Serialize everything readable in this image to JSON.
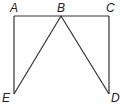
{
  "diagram": {
    "points": {
      "A": {
        "label": "A",
        "x": 14,
        "y": 16
      },
      "B": {
        "label": "B",
        "x": 61,
        "y": 16
      },
      "C": {
        "label": "C",
        "x": 109,
        "y": 16
      },
      "D": {
        "label": "D",
        "x": 109,
        "y": 94
      },
      "E": {
        "label": "E",
        "x": 14,
        "y": 94
      }
    },
    "segments": [
      "AB",
      "BC",
      "AE",
      "CD",
      "BE",
      "BD"
    ],
    "colors": {
      "stroke": "#333333",
      "label": "#222222",
      "background": "#ffffff"
    }
  }
}
